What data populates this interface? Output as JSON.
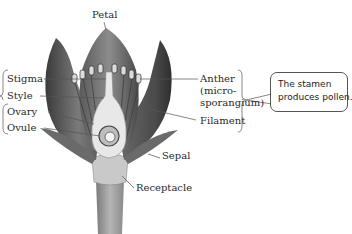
{
  "diagram": {
    "labels": {
      "petal": "Petal",
      "stigma": "Stigma",
      "style": "Style",
      "ovary": "Ovary",
      "ovule": "Ovule",
      "anther_line1": "Anther",
      "anther_line2": "(micro-",
      "anther_line3": "sporangium)",
      "filament": "Filament",
      "sepal": "Sepal",
      "receptacle": "Receptacle"
    },
    "callout": {
      "line1": "The stamen",
      "line2": "produces pollen."
    },
    "colors": {
      "petal_dark": "#4a4a4a",
      "petal_mid": "#8a8a8a",
      "pistil_light": "#e6e6e6",
      "stem": "#9a9a9a",
      "leader_line": "#555555"
    }
  }
}
